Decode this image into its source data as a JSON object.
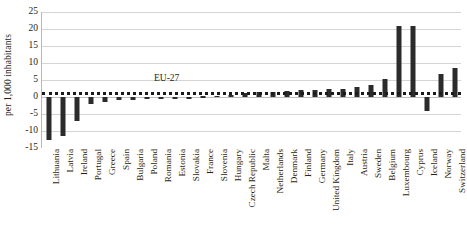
{
  "chart_data": {
    "type": "bar",
    "title": "",
    "xlabel": "",
    "ylabel": "per 1,000 inhabitants",
    "ylim": [
      -15,
      25
    ],
    "yticks": [
      25,
      20,
      15,
      10,
      5,
      0,
      -5,
      -10,
      -15
    ],
    "grid": true,
    "legend": false,
    "categories": [
      "Lithuania",
      "Latvia",
      "Ireland",
      "Portugal",
      "Greece",
      "Spain",
      "Bulgaria",
      "Poland",
      "Romania",
      "Estonia",
      "Slovakia",
      "France",
      "Slovenia",
      "Hungary",
      "Czech Republic",
      "Malta",
      "Netherlands",
      "Denmark",
      "Finland",
      "Germany",
      "United Kingdom",
      "Italy",
      "Austria",
      "Sweden",
      "Belgium",
      "Luxembourg",
      "Cyprus",
      "Iceland",
      "Norway",
      "Switzerland"
    ],
    "values": [
      -12.5,
      -11.5,
      -7.2,
      -2.2,
      -1.4,
      -1.0,
      -0.9,
      -0.5,
      -0.4,
      -0.3,
      -0.2,
      0.2,
      0.4,
      0.6,
      1.2,
      1.4,
      1.6,
      1.8,
      2.0,
      2.1,
      2.3,
      2.5,
      2.9,
      3.4,
      5.4,
      21.0,
      21.0,
      -4.2,
      6.9,
      8.4
    ],
    "annotations": [
      {
        "name": "eu27-reference-line",
        "label": "EU-27",
        "value": 1.5,
        "style": "dotted"
      }
    ],
    "bar_color": "#2b2b2b",
    "gridline_color": "#d4d4d4"
  }
}
